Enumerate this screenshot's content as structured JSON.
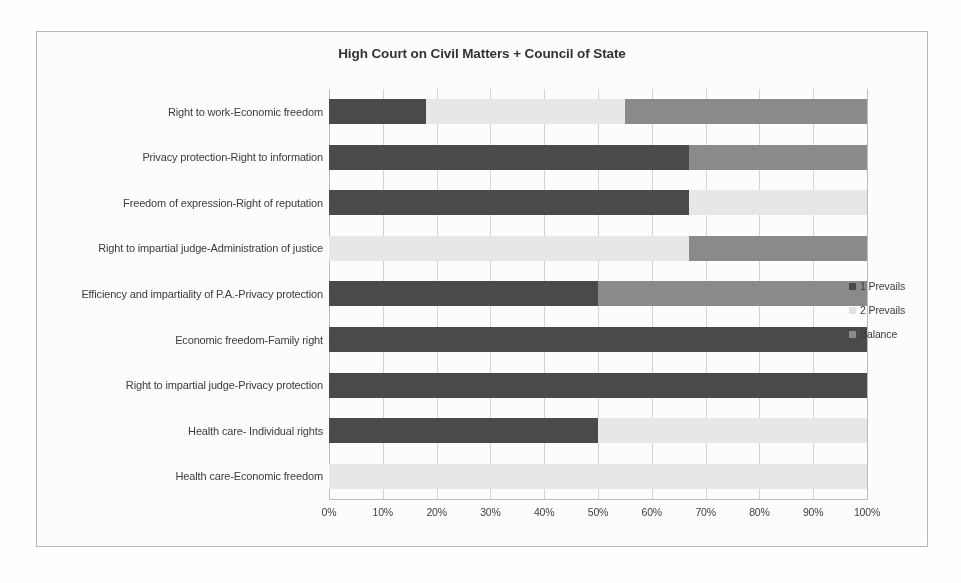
{
  "chart_data": {
    "type": "bar",
    "orientation": "horizontal",
    "stacked": true,
    "normalized_percent": true,
    "title": "High Court on Civil Matters + Council of State",
    "xlabel": "",
    "ylabel": "",
    "xlim": [
      0,
      100
    ],
    "xticks": [
      "0%",
      "10%",
      "20%",
      "30%",
      "40%",
      "50%",
      "60%",
      "70%",
      "80%",
      "90%",
      "100%"
    ],
    "grid": true,
    "legend_position": "right",
    "categories": [
      "Right to work-Economic freedom",
      "Privacy protection-Right to information",
      "Freedom of expression-Right of reputation",
      "Right to impartial judge-Administration of justice",
      "Efficiency and impartiality of P.A.-Privacy protection",
      "Economic freedom-Family right",
      "Right to impartial judge-Privacy protection",
      "Health care- Individual rights",
      "Health care-Economic freedom"
    ],
    "series": [
      {
        "name": "1 Prevails",
        "color": "#4a4a4a",
        "values": [
          18,
          67,
          67,
          0,
          50,
          100,
          100,
          50,
          0
        ]
      },
      {
        "name": "2 Prevails",
        "color": "#e9e9e9",
        "values": [
          37,
          0,
          33,
          67,
          0,
          0,
          0,
          50,
          100
        ]
      },
      {
        "name": "Balance",
        "color": "#8b8b8b",
        "values": [
          45,
          33,
          0,
          33,
          50,
          0,
          0,
          0,
          0
        ]
      }
    ]
  },
  "legend": {
    "items": [
      {
        "label": "1 Prevails",
        "swatch": "s1"
      },
      {
        "label": "2 Prevails",
        "swatch": "s2"
      },
      {
        "label": "Balance",
        "swatch": "s3"
      }
    ]
  }
}
